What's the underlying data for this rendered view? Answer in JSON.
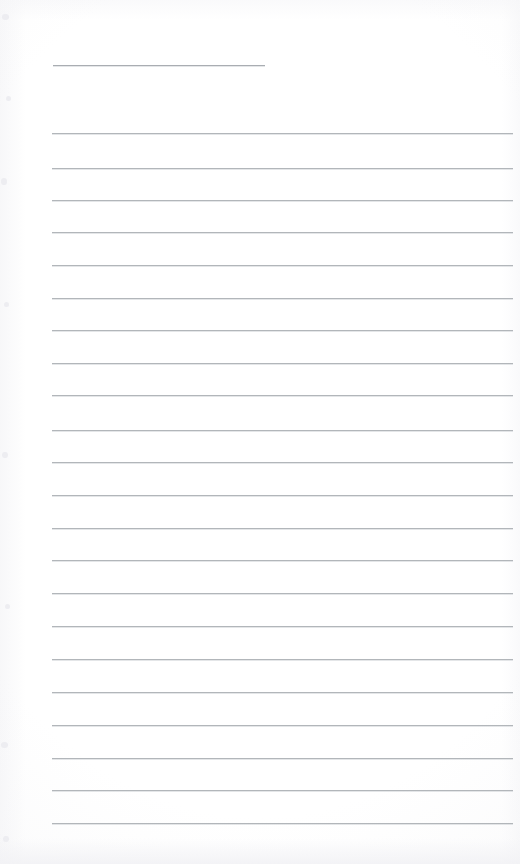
{
  "document": {
    "kind": "scanned-ruled-notepad-page",
    "page_width": 520,
    "page_height": 864,
    "background_color": "#ffffff",
    "paper_tint": "#fefefe",
    "rule_color": "#b2b6ba",
    "rule_thickness_px": 1,
    "written_text": "",
    "note": "Blank ruled page, no handwriting or printed text present"
  },
  "ruling": {
    "left_margin_x": 52,
    "right_margin_x": 513,
    "line_spacing_px": 32.7,
    "first_rule_y": 65,
    "body_first_rule_y": 133,
    "total_rules": 23,
    "short_rule_count": 1,
    "full_rule_count": 22
  },
  "rules": [
    {
      "y": 65,
      "x": 53,
      "width": 212,
      "short": true
    },
    {
      "y": 133,
      "x": 52,
      "width": 461,
      "short": false
    },
    {
      "y": 168,
      "x": 52,
      "width": 461,
      "short": false
    },
    {
      "y": 200,
      "x": 52,
      "width": 461,
      "short": false
    },
    {
      "y": 232,
      "x": 52,
      "width": 461,
      "short": false
    },
    {
      "y": 265,
      "x": 52,
      "width": 461,
      "short": false
    },
    {
      "y": 298,
      "x": 52,
      "width": 461,
      "short": false
    },
    {
      "y": 330,
      "x": 52,
      "width": 461,
      "short": false
    },
    {
      "y": 363,
      "x": 52,
      "width": 461,
      "short": false
    },
    {
      "y": 395,
      "x": 52,
      "width": 461,
      "short": false
    },
    {
      "y": 430,
      "x": 52,
      "width": 461,
      "short": false
    },
    {
      "y": 462,
      "x": 52,
      "width": 461,
      "short": false
    },
    {
      "y": 495,
      "x": 52,
      "width": 461,
      "short": false
    },
    {
      "y": 528,
      "x": 52,
      "width": 461,
      "short": false
    },
    {
      "y": 560,
      "x": 52,
      "width": 461,
      "short": false
    },
    {
      "y": 593,
      "x": 52,
      "width": 461,
      "short": false
    },
    {
      "y": 626,
      "x": 52,
      "width": 461,
      "short": false
    },
    {
      "y": 659,
      "x": 52,
      "width": 461,
      "short": false
    },
    {
      "y": 692,
      "x": 52,
      "width": 461,
      "short": false
    },
    {
      "y": 725,
      "x": 52,
      "width": 461,
      "short": false
    },
    {
      "y": 758,
      "x": 52,
      "width": 461,
      "short": false
    },
    {
      "y": 790,
      "x": 52,
      "width": 461,
      "short": false
    },
    {
      "y": 823,
      "x": 52,
      "width": 461,
      "short": false
    }
  ],
  "edge_specks": [
    {
      "x": 2,
      "y": 14,
      "w": 7,
      "h": 6
    },
    {
      "x": 6,
      "y": 96,
      "w": 5,
      "h": 5
    },
    {
      "x": 1,
      "y": 178,
      "w": 6,
      "h": 7
    },
    {
      "x": 4,
      "y": 302,
      "w": 5,
      "h": 5
    },
    {
      "x": 2,
      "y": 452,
      "w": 6,
      "h": 6
    },
    {
      "x": 5,
      "y": 604,
      "w": 5,
      "h": 5
    },
    {
      "x": 1,
      "y": 742,
      "w": 7,
      "h": 6
    },
    {
      "x": 3,
      "y": 836,
      "w": 6,
      "h": 6
    }
  ]
}
